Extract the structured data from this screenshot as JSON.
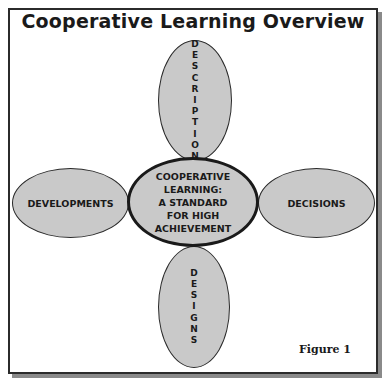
{
  "diagram": {
    "title": "Cooperative Learning Overview",
    "center": {
      "lines": [
        "COOPERATIVE",
        "LEARNING:",
        "A STANDARD",
        "FOR HIGH",
        "ACHIEVEMENT"
      ]
    },
    "nodes": {
      "top": {
        "label": "DESCRIPTION",
        "orientation": "vertical"
      },
      "left": {
        "label": "DEVELOPMENTS",
        "orientation": "horizontal"
      },
      "right": {
        "label": "DECISIONS",
        "orientation": "horizontal"
      },
      "bottom": {
        "label": "DESIGNS",
        "orientation": "vertical"
      }
    },
    "figure_label": "Figure 1",
    "colors": {
      "ellipse_fill": "#c9c9c9",
      "stroke": "#2a2a2a",
      "shadow": "#8a8a8a"
    }
  }
}
